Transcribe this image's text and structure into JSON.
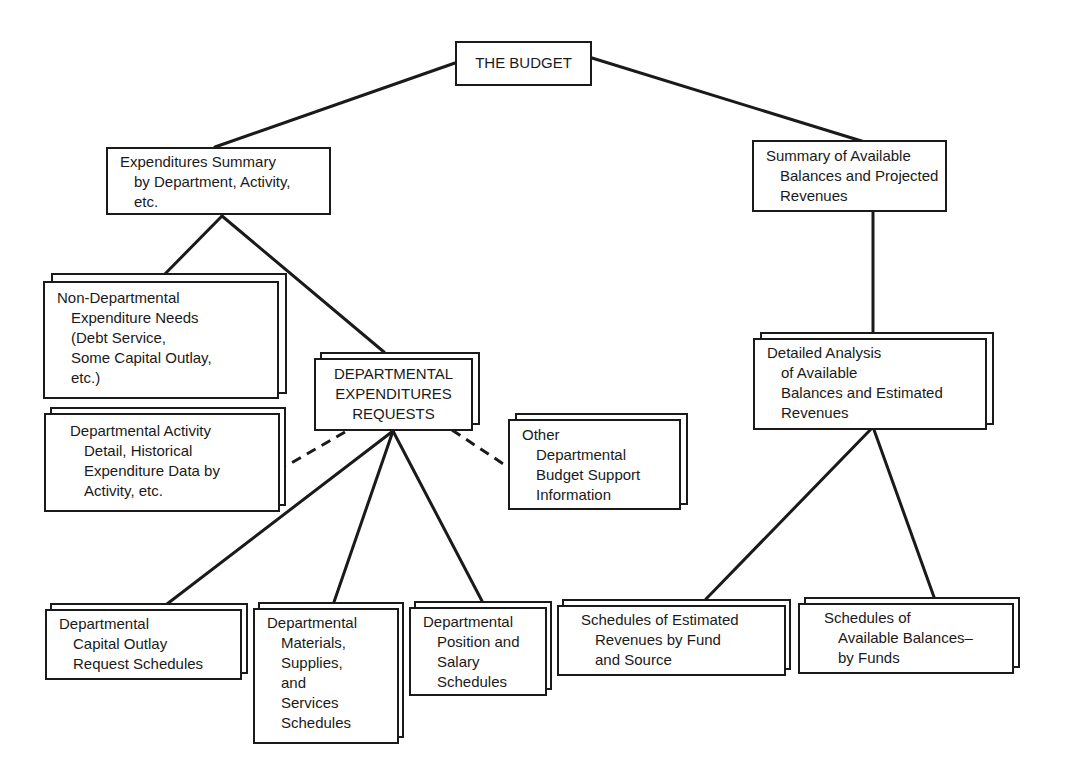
{
  "diagram": {
    "style": {
      "ink_color": "#1a1a1a",
      "background": "#ffffff"
    },
    "nodes": {
      "root": {
        "lines": [
          "THE BUDGET"
        ]
      },
      "expenditures_summary": {
        "lines": [
          "Expenditures Summary",
          "by Department, Activity,",
          "etc."
        ]
      },
      "revenue_summary": {
        "lines": [
          "Summary of Available",
          "Balances and Projected",
          "Revenues"
        ]
      },
      "non_departmental": {
        "lines": [
          "Non-Departmental",
          "Expenditure Needs",
          "(Debt Service,",
          "Some Capital Outlay,",
          "etc.)"
        ]
      },
      "departmental_requests": {
        "lines": [
          "DEPARTMENTAL",
          "EXPENDITURES",
          "REQUESTS"
        ]
      },
      "activity_detail": {
        "lines": [
          "Departmental Activity",
          "Detail, Historical",
          "Expenditure Data by",
          "Activity, etc."
        ]
      },
      "other_support": {
        "lines": [
          "Other",
          "Departmental",
          "Budget Support",
          "Information"
        ]
      },
      "detailed_analysis": {
        "lines": [
          "Detailed Analysis",
          "of Available",
          "Balances and Estimated",
          "Revenues"
        ]
      },
      "capital_outlay": {
        "lines": [
          "Departmental",
          "Capital Outlay",
          "Request Schedules"
        ]
      },
      "materials_supplies": {
        "lines": [
          "Departmental",
          "Materials,",
          "Supplies,",
          "and",
          "Services",
          "Schedules"
        ]
      },
      "position_salary": {
        "lines": [
          "Departmental",
          "Position and",
          "Salary",
          "Schedules"
        ]
      },
      "estimated_revenues": {
        "lines": [
          "Schedules of Estimated",
          "Revenues by Fund",
          "and Source"
        ]
      },
      "available_balances": {
        "lines": [
          "Schedules of",
          "Available Balances–",
          "by Funds"
        ]
      }
    },
    "edges": [
      {
        "from": "root",
        "to": "expenditures_summary",
        "style": "solid"
      },
      {
        "from": "root",
        "to": "revenue_summary",
        "style": "solid"
      },
      {
        "from": "expenditures_summary",
        "to": "non_departmental",
        "style": "solid"
      },
      {
        "from": "expenditures_summary",
        "to": "departmental_requests",
        "style": "solid"
      },
      {
        "from": "departmental_requests",
        "to": "activity_detail",
        "style": "dashed"
      },
      {
        "from": "departmental_requests",
        "to": "other_support",
        "style": "dashed"
      },
      {
        "from": "departmental_requests",
        "to": "capital_outlay",
        "style": "solid"
      },
      {
        "from": "departmental_requests",
        "to": "materials_supplies",
        "style": "solid"
      },
      {
        "from": "departmental_requests",
        "to": "position_salary",
        "style": "solid"
      },
      {
        "from": "revenue_summary",
        "to": "detailed_analysis",
        "style": "solid"
      },
      {
        "from": "detailed_analysis",
        "to": "estimated_revenues",
        "style": "solid"
      },
      {
        "from": "detailed_analysis",
        "to": "available_balances",
        "style": "solid"
      }
    ]
  }
}
